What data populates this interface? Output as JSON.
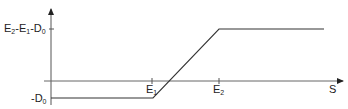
{
  "diagram": {
    "y_labels": {
      "top": {
        "E": "E",
        "s2": "2",
        "m1": "-E",
        "s1": "1",
        "m2": "-D",
        "s0": "0"
      },
      "bottom": {
        "m": "-D",
        "s0": "0"
      }
    },
    "x_labels": {
      "e1": {
        "E": "E",
        "sub": "1"
      },
      "e2": {
        "E": "E",
        "sub": "2"
      },
      "axis": "S"
    },
    "colors": {
      "line": "#333333",
      "axis": "#555555"
    }
  }
}
